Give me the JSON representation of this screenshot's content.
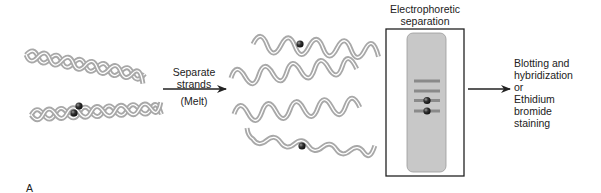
{
  "figure": {
    "panel_label": "A",
    "step1": {
      "description": "Double-stranded DNA",
      "helices": [
        {
          "name": "double-helix-1",
          "labeled": false
        },
        {
          "name": "double-helix-2",
          "labeled": true,
          "label_count": 2
        }
      ]
    },
    "arrow1": {
      "line1": "Separate",
      "line2": "strands",
      "line3": "(Melt)"
    },
    "step2": {
      "description": "Single strands",
      "strands": [
        {
          "name": "single-strand-1",
          "labeled": true
        },
        {
          "name": "single-strand-2",
          "labeled": false
        },
        {
          "name": "single-strand-3",
          "labeled": false
        },
        {
          "name": "single-strand-4",
          "labeled": true
        }
      ]
    },
    "gel": {
      "title_line1": "Electrophoretic",
      "title_line2": "separation",
      "bands": [
        {
          "labeled": false
        },
        {
          "labeled": false
        },
        {
          "labeled": true
        },
        {
          "labeled": true
        }
      ]
    },
    "result": {
      "lines": [
        "Blotting and",
        "hybridization",
        "or",
        "Ethidium",
        "bromide",
        "staining"
      ]
    },
    "colors": {
      "strand": "#a8a8a8",
      "strand_inner": "#ffffff",
      "gel_fill": "#c8c8c8",
      "band": "#8a8a8a",
      "label_dot": "#2a2a2a",
      "line": "#222222"
    }
  }
}
